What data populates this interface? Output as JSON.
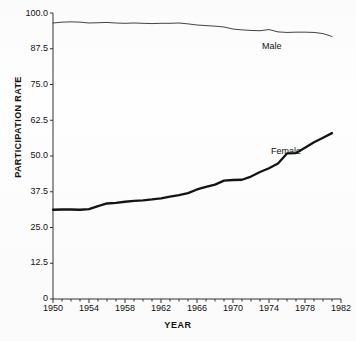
{
  "chart_data": {
    "type": "line",
    "title": "",
    "xlabel": "YEAR",
    "ylabel": "PARTICIPATION RATE",
    "xlim": [
      1950,
      1982
    ],
    "ylim": [
      0,
      100
    ],
    "grid": false,
    "legend_position": "inline-annotation",
    "xticks": [
      "1950",
      "1954",
      "1958",
      "1962",
      "1966",
      "1970",
      "1974",
      "1978",
      "1982"
    ],
    "xtick_values": [
      1950,
      1954,
      1958,
      1962,
      1966,
      1970,
      1974,
      1978,
      1982
    ],
    "yticks": [
      "0",
      "12.5",
      "25.0",
      "37.5",
      "50.0",
      "62.5",
      "75.0",
      "87.5",
      "100.0"
    ],
    "ytick_values": [
      0,
      12.5,
      25,
      37.5,
      50,
      62.5,
      75,
      87.5,
      100
    ],
    "x": [
      1950,
      1951,
      1952,
      1953,
      1954,
      1955,
      1956,
      1957,
      1958,
      1959,
      1960,
      1961,
      1962,
      1963,
      1964,
      1965,
      1966,
      1967,
      1968,
      1969,
      1970,
      1971,
      1972,
      1973,
      1974,
      1975,
      1976,
      1977,
      1978,
      1979,
      1980,
      1981
    ],
    "series": [
      {
        "name": "Male",
        "label": "Male",
        "style": "thin-line",
        "color": "#2a2a2a",
        "values": [
          96.5,
          96.8,
          96.9,
          96.8,
          96.5,
          96.6,
          96.7,
          96.5,
          96.4,
          96.5,
          96.4,
          96.3,
          96.4,
          96.4,
          96.5,
          96.2,
          95.8,
          95.6,
          95.4,
          95.1,
          94.4,
          94.1,
          93.9,
          93.8,
          94.2,
          93.4,
          93.2,
          93.3,
          93.3,
          93.2,
          92.8,
          91.8
        ]
      },
      {
        "name": "Female",
        "label": "Female",
        "style": "thick-line",
        "color": "#111111",
        "values": [
          31.2,
          31.3,
          31.3,
          31.2,
          31.4,
          32.5,
          33.4,
          33.6,
          34.0,
          34.3,
          34.5,
          34.8,
          35.2,
          35.8,
          36.3,
          37.0,
          38.3,
          39.2,
          40.0,
          41.4,
          41.6,
          41.7,
          42.8,
          44.4,
          45.7,
          47.4,
          50.9,
          51.0,
          52.9,
          54.8,
          56.4,
          58.0
        ]
      }
    ],
    "annotations": [
      {
        "text": "Male",
        "x": 1975,
        "y": 89.5
      },
      {
        "text": "Female",
        "x": 1976,
        "y": 53.5
      }
    ]
  }
}
